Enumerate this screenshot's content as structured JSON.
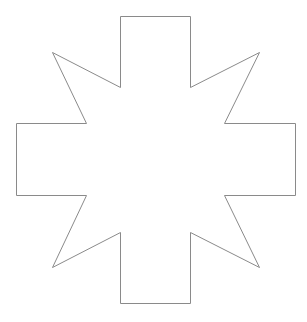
{
  "figure": {
    "shape_name": "cross-star",
    "arm_count": 4,
    "diagonal_point_count": 4,
    "colors": {
      "background": "#ffffff",
      "fill": "#ffffff",
      "stroke": "#8a8a8a"
    }
  }
}
